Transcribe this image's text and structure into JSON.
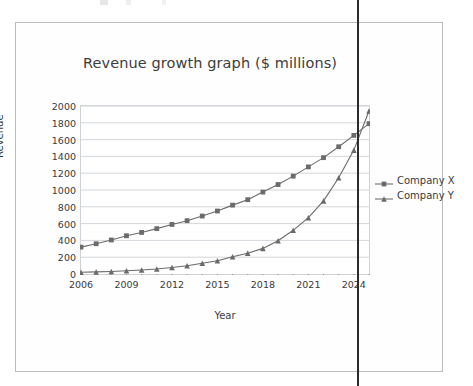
{
  "chart_data": {
    "type": "line",
    "title": "Revenue growth graph ($ millions)",
    "xlabel": "Year",
    "ylabel": "Revenue",
    "xlim": [
      2006,
      2025
    ],
    "ylim": [
      0,
      2000
    ],
    "ytick_step": 200,
    "grid": true,
    "legend_position": "right",
    "yticks": [
      "2000",
      "1800",
      "1600",
      "1400",
      "1200",
      "1000",
      "800",
      "600",
      "400",
      "200",
      "0"
    ],
    "ytick_values": [
      2000,
      1800,
      1600,
      1400,
      1200,
      1000,
      800,
      600,
      400,
      200,
      0
    ],
    "xticks": [
      "2006",
      "2009",
      "2012",
      "2015",
      "2018",
      "2021",
      "2024"
    ],
    "xtick_values": [
      2006,
      2009,
      2012,
      2015,
      2018,
      2021,
      2024
    ],
    "x": [
      2006,
      2007,
      2008,
      2009,
      2010,
      2011,
      2012,
      2013,
      2014,
      2015,
      2016,
      2017,
      2018,
      2019,
      2020,
      2021,
      2022,
      2023,
      2024,
      2025
    ],
    "series": [
      {
        "name": "Company X",
        "marker": "square",
        "color": "#6b6b6b",
        "values": [
          320,
          360,
          405,
          455,
          495,
          540,
          590,
          635,
          690,
          750,
          820,
          885,
          975,
          1065,
          1165,
          1275,
          1385,
          1515,
          1650,
          1790
        ]
      },
      {
        "name": "Company Y",
        "marker": "triangle",
        "color": "#6b6b6b",
        "values": [
          20,
          25,
          30,
          38,
          48,
          60,
          78,
          98,
          128,
          158,
          205,
          248,
          305,
          395,
          520,
          670,
          870,
          1145,
          1475,
          1940
        ]
      }
    ]
  },
  "legend": {
    "items": [
      {
        "label": "Company X",
        "marker": "square"
      },
      {
        "label": "Company Y",
        "marker": "triangle"
      }
    ]
  },
  "colors": {
    "series": "#6b6b6b",
    "grid": "#d3d6da",
    "frame": "#cfd2d6",
    "page_border": "#b9bcc0",
    "rule": "#2b2b2b",
    "text": "#3a3a3a",
    "title_text": "#3d3d3d"
  }
}
